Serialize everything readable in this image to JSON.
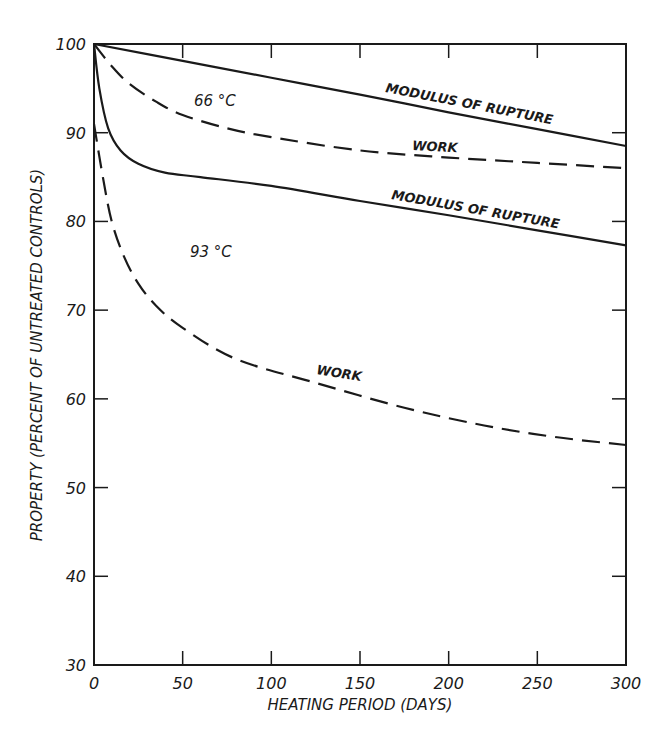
{
  "chart_data": {
    "type": "line",
    "title": "",
    "xlabel": "HEATING PERIOD (DAYS)",
    "ylabel": "PROPERTY (PERCENT OF UNTREATED CONTROLS)",
    "xlim": [
      0,
      300
    ],
    "ylim": [
      30,
      100
    ],
    "xticks": [
      0,
      50,
      100,
      150,
      200,
      250,
      300
    ],
    "yticks": [
      30,
      40,
      50,
      60,
      70,
      80,
      90,
      100
    ],
    "grid": false,
    "legend": "none (inline labels)",
    "annotations": [
      {
        "text": "66 °C",
        "x": 60,
        "y": 95.5
      },
      {
        "text": "93 °C",
        "x": 55,
        "y": 76.5
      },
      {
        "text": "MODULUS OF RUPTURE",
        "x": 222,
        "y": 91.5,
        "series": "66 °C modulus of rupture"
      },
      {
        "text": "WORK",
        "x": 185,
        "y": 88.2,
        "series": "66 °C work"
      },
      {
        "text": "MODULUS OF RUPTURE",
        "x": 228,
        "y": 80.5,
        "series": "93 °C modulus of rupture"
      },
      {
        "text": "WORK",
        "x": 140,
        "y": 61.8,
        "series": "93 °C work"
      }
    ],
    "series": [
      {
        "name": "66 °C Modulus of Rupture",
        "style": "solid",
        "x": [
          0,
          50,
          100,
          150,
          200,
          250,
          300
        ],
        "values": [
          100,
          98.1,
          96.2,
          94.3,
          92.3,
          90.4,
          88.5
        ]
      },
      {
        "name": "66 °C Work",
        "style": "dashed",
        "x": [
          0,
          10,
          20,
          35,
          50,
          75,
          100,
          150,
          200,
          250,
          300
        ],
        "values": [
          100,
          97.5,
          95.5,
          93.5,
          92,
          90.5,
          89.5,
          88,
          87.2,
          86.6,
          86
        ]
      },
      {
        "name": "93 °C Modulus of Rupture",
        "style": "solid",
        "x": [
          0,
          3,
          8,
          15,
          25,
          40,
          60,
          100,
          150,
          200,
          250,
          300
        ],
        "values": [
          100,
          95,
          90.5,
          88,
          86.5,
          85.5,
          85,
          84,
          82.3,
          80.7,
          79,
          77.3
        ]
      },
      {
        "name": "93 °C Work",
        "style": "dashed",
        "x": [
          0,
          5,
          10,
          17,
          25,
          35,
          50,
          80,
          125,
          175,
          220,
          260,
          300
        ],
        "values": [
          91,
          85,
          80,
          76,
          73,
          70.5,
          68,
          64.5,
          61.8,
          59,
          57,
          55.7,
          54.8
        ]
      }
    ]
  },
  "axes": {
    "x_tick_labels": [
      "0",
      "50",
      "100",
      "150",
      "200",
      "250",
      "300"
    ],
    "y_tick_labels": [
      "30",
      "40",
      "50",
      "60",
      "70",
      "80",
      "90",
      "100"
    ],
    "xlabel": "HEATING PERIOD (DAYS)",
    "ylabel": "PROPERTY (PERCENT OF UNTREATED CONTROLS)"
  },
  "labels": {
    "t66": "66 °C",
    "t93": "93 °C",
    "mor66": "MODULUS OF RUPTURE",
    "work66": "WORK",
    "mor93": "MODULUS OF RUPTURE",
    "work93": "WORK"
  }
}
